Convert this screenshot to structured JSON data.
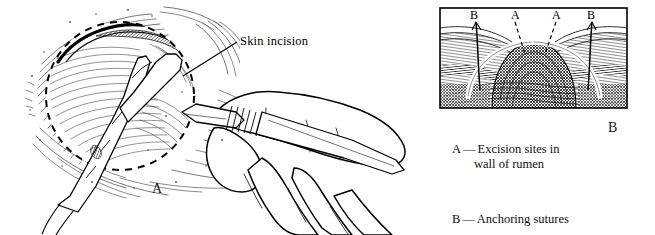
{
  "figure": {
    "background_color": "#ffffff",
    "ink_color": "#000000",
    "title_present": false
  },
  "panel_a": {
    "letter": "A",
    "annotation": {
      "label": "Skin incision",
      "leader_line": "solid"
    },
    "description": "Surgical illustration of a flank incision with a hand holding a scalpel and tissue forceps retracting the wound edge; dashed circle marks the incision outline."
  },
  "panel_b": {
    "letter": "B",
    "boxed_illustration": {
      "border_color": "#000000",
      "labels": [
        {
          "text": "B",
          "leader": "solid",
          "side": "left"
        },
        {
          "text": "A",
          "leader": "dashed",
          "side": "left-center"
        },
        {
          "text": "A",
          "leader": "dashed",
          "side": "right-center"
        },
        {
          "text": "B",
          "leader": "solid",
          "side": "right"
        }
      ],
      "description": "Cross-section of the exteriorized rumen wall forming a dome, with white anchoring sutures arcing over the skin edges."
    },
    "legend": [
      {
        "key": "A",
        "dash": "—",
        "line1": "Excision sites in",
        "line2": "wall of rumen"
      },
      {
        "key": "B",
        "dash": "—",
        "line1": "Anchoring sutures",
        "line2": ""
      }
    ]
  }
}
